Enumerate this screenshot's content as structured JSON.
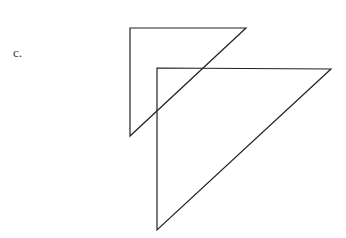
{
  "label": "c.",
  "shapes": [
    {
      "name": "small-triangle",
      "points": "130,28 246,28 130,136"
    },
    {
      "name": "large-triangle",
      "points": "157,68 331,69 157,230"
    }
  ],
  "stroke_color": "#222222"
}
